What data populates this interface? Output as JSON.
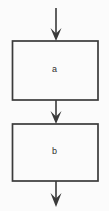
{
  "diagram": {
    "type": "flowchart",
    "orientation": "vertical-top-to-bottom",
    "background_color": "#fbfbfb",
    "stroke_color": "#3a3a3a",
    "node_fill_color": "#fbfbfb",
    "text_color": "#2f2f2f",
    "nodes": [
      {
        "id": "a",
        "label": "a",
        "shape": "rectangle",
        "x": 12,
        "y": 41,
        "width": 86,
        "height": 59
      },
      {
        "id": "b",
        "label": "b",
        "shape": "rectangle",
        "x": 12,
        "y": 124,
        "width": 86,
        "height": 57
      }
    ],
    "edges": [
      {
        "id": "entry-arrow",
        "from": "",
        "to": "a",
        "arrowhead": "v-shape",
        "x": 56,
        "y_start": 8,
        "y_end": 41
      },
      {
        "id": "a-to-b-arrow",
        "from": "a",
        "to": "b",
        "arrowhead": "v-shape",
        "x": 56,
        "y_start": 100,
        "y_end": 124
      },
      {
        "id": "exit-arrow",
        "from": "b",
        "to": "",
        "arrowhead": "v-shape",
        "x": 56,
        "y_start": 181,
        "y_end": 207
      }
    ]
  }
}
